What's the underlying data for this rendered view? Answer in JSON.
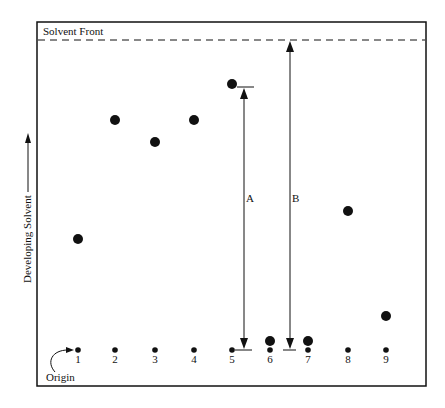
{
  "diagram": {
    "solvent_front_label": "Solvent Front",
    "axis_label": "Developing Solvent",
    "origin_label": "Origin",
    "measure_a_label": "A",
    "measure_b_label": "B",
    "colors": {
      "ink": "#111111",
      "background": "#ffffff"
    },
    "lanes": [
      {
        "label": "1",
        "x": 78,
        "spot_y": 239,
        "spot_r": 5
      },
      {
        "label": "2",
        "x": 115,
        "spot_y": 120,
        "spot_r": 5
      },
      {
        "label": "3",
        "x": 155,
        "spot_y": 142,
        "spot_r": 5
      },
      {
        "label": "4",
        "x": 194,
        "spot_y": 120,
        "spot_r": 5
      },
      {
        "label": "5",
        "x": 232,
        "spot_y": 84,
        "spot_r": 5
      },
      {
        "label": "6",
        "x": 270,
        "spot_y": 341,
        "spot_r": 5
      },
      {
        "label": "7",
        "x": 308,
        "spot_y": 341,
        "spot_r": 5
      },
      {
        "label": "8",
        "x": 348,
        "spot_y": 211,
        "spot_r": 5
      },
      {
        "label": "9",
        "x": 386,
        "spot_y": 316,
        "spot_r": 5
      }
    ]
  }
}
